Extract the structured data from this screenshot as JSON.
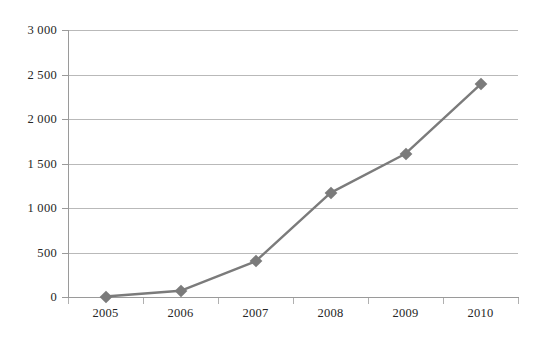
{
  "chart_data": {
    "type": "line",
    "title": "",
    "subtitle": "",
    "xlabel": "",
    "ylabel": "",
    "categories": [
      "2005",
      "2006",
      "2007",
      "2008",
      "2009",
      "2010"
    ],
    "series": [
      {
        "name": "Series 1",
        "values": [
          5,
          70,
          400,
          1170,
          1610,
          2390
        ],
        "color": "#7b7b7b",
        "marker": "diamond"
      }
    ],
    "ylim": [
      0,
      3000
    ],
    "ytick_values": [
      0,
      500,
      1000,
      1500,
      2000,
      2500,
      3000
    ],
    "ytick_labels": [
      "0",
      "500",
      "1 000",
      "1 500",
      "2 000",
      "2 500",
      "3 000"
    ],
    "xtick_labels": [
      "2005",
      "2006",
      "2007",
      "2008",
      "2009",
      "2010"
    ],
    "grid": {
      "horizontal": true,
      "vertical": false,
      "color": "#b9b9b9"
    },
    "legend": {
      "visible": false,
      "position": "none"
    },
    "axes": {
      "y_axis_line": true,
      "x_axis_line": true,
      "axis_color": "#9a9a9a",
      "tick_marks": true
    },
    "background": "#ffffff",
    "text_color": "#262626"
  }
}
